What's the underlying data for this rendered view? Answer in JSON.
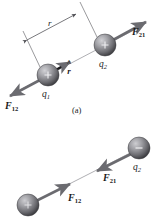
{
  "figure": {
    "caption_a": "(a)",
    "colors": {
      "line": "#55555a",
      "arrow": "#6b6b70",
      "sphere_dark": "#4a4a4e",
      "sphere_mid": "#8a8a8f",
      "sphere_light": "#c8c8cc",
      "text": "#1b1b1b",
      "background": "#ffffff"
    }
  },
  "panel_a": {
    "name": "repulsion-panel",
    "distance_label": "r",
    "unit_vector_label": "r",
    "unit_vector_hat": "^",
    "charges": [
      {
        "id": "q1",
        "label": "q",
        "sub": "1",
        "sign": "+",
        "cx": 48,
        "cy": 75,
        "r": 11
      },
      {
        "id": "q2",
        "label": "q",
        "sub": "2",
        "sign": "+",
        "cx": 105,
        "cy": 45,
        "r": 11
      }
    ],
    "forces": [
      {
        "id": "F12",
        "label": "F",
        "sub": "12",
        "direction": "down-left",
        "on_charge": "q1"
      },
      {
        "id": "F21",
        "label": "F",
        "sub": "21",
        "direction": "up-right",
        "on_charge": "q2"
      }
    ]
  },
  "panel_b": {
    "name": "attraction-panel",
    "charges": [
      {
        "id": "q1",
        "label": "q",
        "sub": "1",
        "sign": "+",
        "cx": 28,
        "cy": 205,
        "r": 11
      },
      {
        "id": "q2",
        "label": "q",
        "sub": "2",
        "sign": "−",
        "cx": 139,
        "cy": 148,
        "r": 11
      }
    ],
    "forces": [
      {
        "id": "F12",
        "label": "F",
        "sub": "12",
        "direction": "up-right",
        "on_charge": "q1"
      },
      {
        "id": "F21",
        "label": "F",
        "sub": "21",
        "direction": "down-left",
        "on_charge": "q2"
      }
    ]
  }
}
